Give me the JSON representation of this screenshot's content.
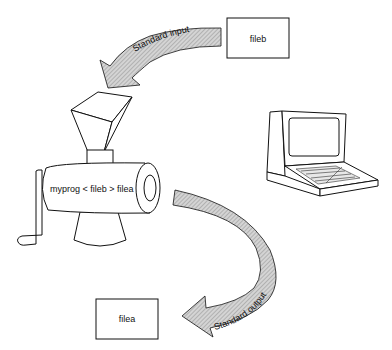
{
  "diagram": {
    "input_file": {
      "label": "fileb"
    },
    "output_file": {
      "label": "filea"
    },
    "program": {
      "command": "myprog < fileb > filea"
    },
    "arrows": {
      "stdin": {
        "label": "Standard input"
      },
      "stdout": {
        "label": "Standard output"
      }
    },
    "icons": {
      "program": "meat-grinder-icon",
      "terminal": "computer-terminal-icon"
    },
    "colors": {
      "stroke": "#111111",
      "arrow_fill": "#b8b8b8",
      "background": "#ffffff"
    }
  }
}
